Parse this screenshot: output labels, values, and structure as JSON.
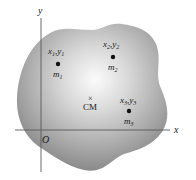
{
  "diagram": {
    "axes": {
      "x_label": "x",
      "y_label": "y",
      "origin_label": "O"
    },
    "particles": [
      {
        "coord_x": "x",
        "coord_y": "y",
        "sub": "1",
        "mass": "m",
        "mass_sub": "1"
      },
      {
        "coord_x": "x",
        "coord_y": "y",
        "sub": "2",
        "mass": "m",
        "mass_sub": "2"
      },
      {
        "coord_x": "x",
        "coord_y": "y",
        "sub": "3",
        "mass": "m",
        "mass_sub": "3"
      }
    ],
    "center_of_mass": {
      "marker": "×",
      "label": "CM"
    },
    "colors": {
      "body_light": "#f4f4f4",
      "body_dark": "#8c8c8c",
      "axis": "#555555",
      "dot": "#111111"
    }
  }
}
